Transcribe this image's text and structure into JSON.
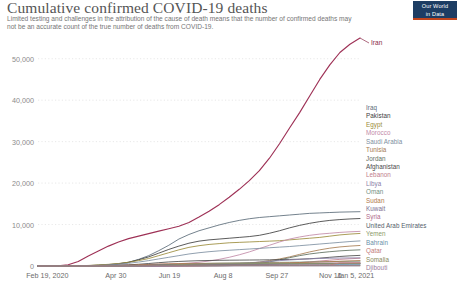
{
  "header": {
    "title": "Cumulative confirmed COVID-19 deaths",
    "subtitle": "Limited testing and challenges in the attribution of the cause of death means that the number of confirmed deaths may not be an accurate count of the true number of deaths from COVID-19.",
    "logo_line1": "Our World",
    "logo_line2": "in Data"
  },
  "chart_data": {
    "type": "line",
    "title": "Cumulative confirmed COVID-19 deaths",
    "subtitle": "Limited testing and challenges in the attribution of the cause of death means that the number of confirmed deaths may not be an accurate count of the true number of deaths from COVID-19.",
    "xlabel": "",
    "ylabel": "",
    "grid": "horizontal-dotted",
    "legend_position": "right",
    "ylim": [
      0,
      55000
    ],
    "ytick_labels": [
      "0",
      "10,000",
      "20,000",
      "30,000",
      "40,000",
      "50,000"
    ],
    "ytick_values": [
      0,
      10000,
      20000,
      30000,
      40000,
      50000
    ],
    "xtick_labels": [
      "Feb 19, 2020",
      "Apr 30",
      "Jun 19",
      "Aug 8",
      "Sep 27",
      "Nov 16",
      "Jan 5, 2021"
    ],
    "xtick_positions": [
      0,
      0.2417,
      0.4083,
      0.575,
      0.7417,
      0.9083,
      1.0
    ],
    "x_start": "Feb 19, 2020",
    "x_end": "Jan 5, 2021",
    "callout": {
      "label": "Iran",
      "color": "#8b2b4b"
    },
    "series": [
      {
        "name": "Iran",
        "color": "#9e3156",
        "values": [
          0,
          0,
          50,
          300,
          1100,
          2400,
          3600,
          4800,
          5800,
          6600,
          7200,
          7800,
          8400,
          9000,
          9600,
          10500,
          11800,
          13200,
          14800,
          16600,
          18500,
          20600,
          23000,
          26000,
          29500,
          33300,
          37000,
          41000,
          45000,
          48500,
          51500,
          53500,
          55000
        ]
      },
      {
        "name": "Iraq",
        "color": "#5b6b78",
        "values": [
          0,
          0,
          0,
          10,
          40,
          90,
          170,
          300,
          500,
          900,
          1600,
          2500,
          3700,
          5000,
          6500,
          7600,
          8500,
          9200,
          9900,
          10500,
          11000,
          11400,
          11700,
          11900,
          12100,
          12300,
          12500,
          12700,
          12800,
          12900,
          13000,
          13050,
          13100
        ]
      },
      {
        "name": "Pakistan",
        "color": "#3d3d3d",
        "values": [
          0,
          0,
          0,
          10,
          40,
          100,
          200,
          350,
          550,
          900,
          1500,
          2200,
          3100,
          4000,
          4800,
          5500,
          6000,
          6300,
          6500,
          6700,
          6900,
          7100,
          7400,
          7900,
          8500,
          9200,
          9800,
          10300,
          10700,
          11000,
          11200,
          11350,
          11450
        ]
      },
      {
        "name": "Egypt",
        "color": "#9b8b3a",
        "values": [
          0,
          0,
          0,
          10,
          50,
          130,
          250,
          400,
          600,
          900,
          1300,
          1800,
          2500,
          3200,
          3900,
          4500,
          4900,
          5200,
          5400,
          5600,
          5700,
          5800,
          5900,
          6000,
          6100,
          6300,
          6500,
          6700,
          6900,
          7200,
          7500,
          7700,
          7850
        ]
      },
      {
        "name": "Morocco",
        "color": "#c28aa8",
        "values": [
          0,
          0,
          0,
          5,
          20,
          50,
          100,
          160,
          220,
          270,
          320,
          370,
          420,
          480,
          560,
          700,
          900,
          1200,
          1600,
          2100,
          2700,
          3400,
          4200,
          5000,
          5800,
          6500,
          7000,
          7400,
          7700,
          7900,
          8100,
          8250,
          8350
        ]
      },
      {
        "name": "Saudi Arabia",
        "color": "#7d8fa0",
        "values": [
          0,
          0,
          0,
          5,
          20,
          60,
          130,
          250,
          420,
          650,
          950,
          1300,
          1700,
          2100,
          2500,
          2900,
          3200,
          3450,
          3650,
          3800,
          3950,
          4100,
          4250,
          4400,
          4550,
          4700,
          4900,
          5100,
          5300,
          5500,
          5700,
          5900,
          6050
        ]
      },
      {
        "name": "Tunisia",
        "color": "#a67c52",
        "values": [
          0,
          0,
          0,
          2,
          8,
          20,
          35,
          45,
          50,
          52,
          54,
          55,
          56,
          58,
          62,
          70,
          85,
          110,
          160,
          250,
          400,
          650,
          950,
          1300,
          1700,
          2200,
          2800,
          3400,
          3900,
          4300,
          4600,
          4800,
          4950
        ]
      },
      {
        "name": "Jordan",
        "color": "#5f6f5f",
        "values": [
          0,
          0,
          0,
          1,
          5,
          8,
          9,
          9,
          10,
          10,
          10,
          11,
          11,
          12,
          13,
          15,
          18,
          25,
          40,
          80,
          160,
          320,
          600,
          1000,
          1500,
          2000,
          2500,
          2900,
          3200,
          3450,
          3650,
          3800,
          3900
        ]
      },
      {
        "name": "Afghanistan",
        "color": "#4a4a4a",
        "values": [
          0,
          0,
          0,
          2,
          10,
          30,
          60,
          110,
          180,
          280,
          420,
          600,
          800,
          980,
          1100,
          1200,
          1280,
          1330,
          1370,
          1400,
          1420,
          1440,
          1460,
          1490,
          1530,
          1580,
          1650,
          1750,
          1900,
          2100,
          2300,
          2450,
          2560
        ]
      },
      {
        "name": "Lebanon",
        "color": "#c17d8c",
        "values": [
          0,
          0,
          0,
          2,
          8,
          16,
          22,
          24,
          26,
          27,
          28,
          29,
          30,
          32,
          36,
          42,
          52,
          68,
          90,
          120,
          160,
          220,
          300,
          400,
          520,
          660,
          820,
          1000,
          1200,
          1400,
          1600,
          1750,
          1870
        ]
      },
      {
        "name": "Libya",
        "color": "#8a7fa8",
        "values": [
          0,
          0,
          0,
          0,
          1,
          3,
          5,
          6,
          7,
          8,
          10,
          15,
          25,
          45,
          75,
          120,
          180,
          260,
          360,
          480,
          620,
          780,
          950,
          1120,
          1290,
          1450,
          1600,
          1730,
          1820,
          1880,
          1920,
          1950,
          1970
        ]
      },
      {
        "name": "Oman",
        "color": "#6f8f7f",
        "values": [
          0,
          0,
          0,
          1,
          3,
          6,
          10,
          20,
          35,
          60,
          100,
          160,
          240,
          330,
          420,
          500,
          570,
          630,
          680,
          720,
          760,
          790,
          820,
          850,
          880,
          910,
          940,
          980,
          1020,
          1060,
          1100,
          1130,
          1150
        ]
      },
      {
        "name": "Sudan",
        "color": "#b07a4a",
        "values": [
          0,
          0,
          0,
          1,
          4,
          12,
          30,
          60,
          110,
          180,
          270,
          370,
          460,
          530,
          580,
          610,
          630,
          645,
          655,
          665,
          675,
          685,
          700,
          720,
          750,
          790,
          840,
          900,
          970,
          1050,
          1140,
          1230,
          1310
        ]
      },
      {
        "name": "Kuwait",
        "color": "#7b6f8f",
        "values": [
          0,
          0,
          0,
          1,
          2,
          5,
          10,
          20,
          35,
          60,
          100,
          150,
          210,
          270,
          330,
          380,
          420,
          450,
          470,
          490,
          505,
          520,
          535,
          550,
          565,
          580,
          595,
          610,
          625,
          640,
          655,
          670,
          680
        ]
      },
      {
        "name": "Syria",
        "color": "#b06a8a",
        "values": [
          0,
          0,
          0,
          0,
          1,
          2,
          3,
          4,
          5,
          6,
          8,
          12,
          18,
          28,
          42,
          60,
          85,
          115,
          150,
          190,
          235,
          285,
          340,
          400,
          460,
          520,
          570,
          620,
          660,
          690,
          710,
          725,
          735
        ]
      },
      {
        "name": "United Arab Emirates",
        "color": "#55606b",
        "values": [
          0,
          0,
          0,
          1,
          3,
          8,
          16,
          30,
          50,
          80,
          120,
          160,
          200,
          240,
          270,
          300,
          320,
          340,
          355,
          370,
          385,
          400,
          415,
          430,
          445,
          460,
          480,
          500,
          520,
          545,
          570,
          595,
          615
        ]
      },
      {
        "name": "Yemen",
        "color": "#8a9a6a",
        "values": [
          0,
          0,
          0,
          0,
          0,
          0,
          1,
          2,
          5,
          15,
          40,
          90,
          160,
          250,
          340,
          410,
          460,
          500,
          525,
          545,
          560,
          572,
          580,
          588,
          594,
          600,
          606,
          612,
          618,
          624,
          630,
          606,
          612
        ]
      },
      {
        "name": "Bahrain",
        "color": "#6b8fa8",
        "values": [
          0,
          0,
          0,
          0,
          1,
          2,
          4,
          7,
          12,
          20,
          32,
          48,
          68,
          92,
          118,
          145,
          170,
          192,
          210,
          225,
          238,
          250,
          262,
          274,
          286,
          298,
          310,
          322,
          334,
          346,
          356,
          364,
          370
        ]
      },
      {
        "name": "Qatar",
        "color": "#c27a7a",
        "values": [
          0,
          0,
          0,
          0,
          1,
          3,
          7,
          14,
          25,
          42,
          65,
          92,
          120,
          145,
          165,
          180,
          192,
          200,
          206,
          211,
          215,
          219,
          223,
          227,
          231,
          235,
          239,
          243,
          247,
          251,
          735,
          743,
          748
        ]
      },
      {
        "name": "Somalia",
        "color": "#8a8a5a",
        "values": [
          0,
          0,
          0,
          0,
          1,
          4,
          12,
          28,
          50,
          70,
          85,
          93,
          98,
          101,
          103,
          105,
          106,
          107,
          108,
          109,
          110,
          111,
          112,
          113,
          114,
          115,
          116,
          118,
          120,
          122,
          124,
          126,
          128
        ]
      },
      {
        "name": "Djibouti",
        "color": "#9a7a9a",
        "values": [
          0,
          0,
          0,
          0,
          0,
          1,
          3,
          8,
          14,
          20,
          26,
          30,
          33,
          35,
          37,
          39,
          41,
          43,
          45,
          47,
          49,
          51,
          53,
          55,
          57,
          59,
          61,
          62,
          62,
          62,
          62,
          62,
          62
        ]
      }
    ]
  },
  "legend": {
    "items": [
      {
        "label": "Iraq",
        "color": "#5b6b78"
      },
      {
        "label": "Pakistan",
        "color": "#3d3d3d"
      },
      {
        "label": "Egypt",
        "color": "#9b8b3a"
      },
      {
        "label": "Morocco",
        "color": "#c28aa8"
      },
      {
        "label": "Saudi Arabia",
        "color": "#7d8fa0"
      },
      {
        "label": "Tunisia",
        "color": "#a67c52"
      },
      {
        "label": "Jordan",
        "color": "#5f6f5f"
      },
      {
        "label": "Afghanistan",
        "color": "#4a4a4a"
      },
      {
        "label": "Lebanon",
        "color": "#c17d8c"
      },
      {
        "label": "Libya",
        "color": "#8a7fa8"
      },
      {
        "label": "Oman",
        "color": "#6f8f7f"
      },
      {
        "label": "Sudan",
        "color": "#b07a4a"
      },
      {
        "label": "Kuwait",
        "color": "#7b6f8f"
      },
      {
        "label": "Syria",
        "color": "#b06a8a"
      },
      {
        "label": "United Arab Emirates",
        "color": "#55606b"
      },
      {
        "label": "Yemen",
        "color": "#8a9a6a"
      },
      {
        "label": "Bahrain",
        "color": "#6b8fa8"
      },
      {
        "label": "Qatar",
        "color": "#c27a7a"
      },
      {
        "label": "Somalia",
        "color": "#8a8a5a"
      },
      {
        "label": "Djibouti",
        "color": "#9a7a9a"
      }
    ]
  }
}
